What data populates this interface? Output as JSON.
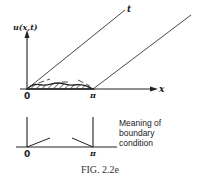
{
  "figure": {
    "caption": "FIG. 2.2e",
    "top_diagram": {
      "y_axis_label": "u(x,t)",
      "x_axis_label": "x",
      "characteristic_label": "t",
      "tick_labels": [
        "0",
        "π"
      ]
    },
    "bottom_diagram": {
      "tick_labels": [
        "0",
        "π"
      ],
      "note_lines": [
        "Meaning of",
        "boundary",
        "condition"
      ]
    },
    "colors": {
      "ink": "#222222",
      "background": "#ffffff"
    }
  }
}
